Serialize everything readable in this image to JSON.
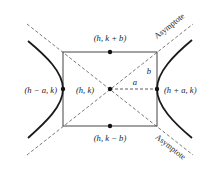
{
  "diagram": {
    "colors": {
      "stroke": "#333333",
      "curve": "#1a1a1a",
      "dashed": "#555555",
      "background": "#ffffff"
    },
    "labels": {
      "top_vertex": "(h, k + b)",
      "bottom_vertex": "(h, k − b)",
      "center": "(h, k)",
      "left_vertex": "(h − a, k)",
      "right_vertex": "(h + a, k)",
      "semi_axis_a": "a",
      "semi_axis_b": "b",
      "asymptote_upper": "Asymptote",
      "asymptote_lower": "Asymptote"
    },
    "points": {
      "center": [
        110,
        89
      ],
      "top": [
        110,
        52
      ],
      "bottom": [
        110,
        126
      ],
      "left_vertex": [
        63,
        89
      ],
      "right_vertex": [
        157,
        89
      ]
    },
    "rectangle": {
      "x": 63,
      "y": 52,
      "width": 94,
      "height": 74
    }
  }
}
